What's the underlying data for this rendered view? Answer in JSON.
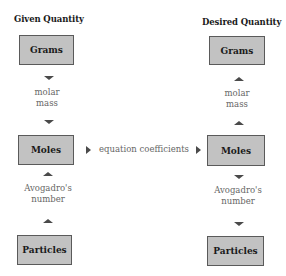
{
  "diagram": {
    "left_column": {
      "title": "Given Quantity",
      "boxes": {
        "grams": "Grams",
        "moles": "Moles",
        "particles": "Particles"
      },
      "labels": {
        "molar_mass": [
          "molar",
          "mass"
        ],
        "avogadro": [
          "Avogadro's",
          "number"
        ]
      },
      "arrows": {
        "grams_to_moles": "down",
        "particles_to_moles": "up"
      }
    },
    "right_column": {
      "title": "Desired Quantity",
      "boxes": {
        "grams": "Grams",
        "moles": "Moles",
        "particles": "Particles"
      },
      "labels": {
        "molar_mass": [
          "molar",
          "mass"
        ],
        "avogadro": [
          "Avogadro's",
          "number"
        ]
      },
      "arrows": {
        "moles_to_grams": "up",
        "moles_to_particles": "down"
      }
    },
    "connector": {
      "label": "equation coefficients",
      "arrows": [
        "right",
        "right"
      ]
    },
    "colors": {
      "box_fill": "#c2c2c2",
      "box_border": "#5a5a5a",
      "arrow": "#4a4a4a",
      "label_text": "#666666"
    }
  }
}
